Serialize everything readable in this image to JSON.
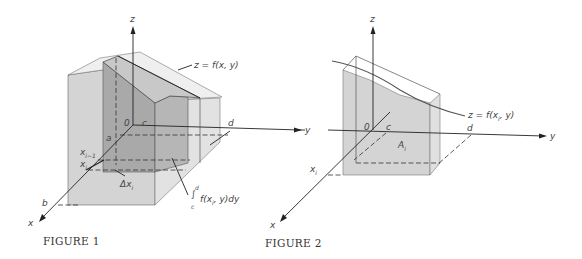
{
  "figures": [
    {
      "caption": "FIGURE 1",
      "axes": {
        "x": "x",
        "y": "y",
        "z": "z"
      },
      "origin_label": "0",
      "limits": {
        "a": "a",
        "b": "b",
        "c": "c",
        "d": "d"
      },
      "partition": {
        "x_prev": "x",
        "x_prev_sub": "i−1",
        "x_i": "x",
        "x_i_sub": "i"
      },
      "delta": {
        "text": "Δx",
        "sub": "i"
      },
      "surface_label": "z = f(x, y)",
      "integral_label": {
        "upper": "d",
        "lower": "c",
        "body": "f(x",
        "body_sub": "i",
        "body_rest": ", y)dy"
      }
    },
    {
      "caption": "FIGURE 2",
      "axes": {
        "x": "x",
        "y": "y",
        "z": "z"
      },
      "origin_label": "0",
      "limits": {
        "c": "c",
        "d": "d"
      },
      "x_i": {
        "text": "x",
        "sub": "i"
      },
      "area": {
        "text": "A",
        "sub": "i"
      },
      "curve_label": {
        "text": "z = f(x",
        "sub": "i",
        "rest": ", y)"
      }
    }
  ],
  "colors": {
    "solid_light": "#d9d9d9",
    "solid_mid": "#c4c4c4",
    "slab_dark": "#a8a8a8",
    "axis": "#222222"
  }
}
